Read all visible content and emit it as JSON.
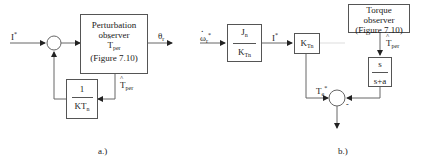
{
  "diagram_a": {
    "caption": "a.)",
    "input_label": "I",
    "input_sup": "*",
    "observer_box": {
      "line1": "Perturbation",
      "line2": "observer",
      "line3_main": "T",
      "line3_sub": "per",
      "line4": "(Figure 7.10)"
    },
    "output_label_main": "θ",
    "output_label_sub": "r",
    "feedback_signal_main": "T",
    "feedback_signal_sub": "per",
    "gain_box": {
      "numerator": "1",
      "denominator_main": "KT",
      "denominator_sub": "n"
    }
  },
  "diagram_b": {
    "caption": "b.)",
    "input_label_main": "ω",
    "input_label_sub": "r",
    "input_label_sup": "*",
    "inertia_box": {
      "numerator_main": "J",
      "numerator_sub": "n",
      "denominator_main": "K",
      "denominator_sub": "Tn"
    },
    "current_label": "I",
    "current_sup": "*",
    "torque_const_box": {
      "main": "K",
      "sub": "Tn"
    },
    "torque_observer_box": {
      "line1": "Torque",
      "line2": "observer",
      "line3": "(Figure 7.10)"
    },
    "estimate_label_main": "T",
    "estimate_label_sub": "per",
    "filter_box": {
      "numerator": "s",
      "denominator": "s+a"
    },
    "torque_ref_label_main": "T",
    "torque_ref_label_sub": "e",
    "torque_ref_label_sup": "*",
    "sum_sign": "-"
  }
}
